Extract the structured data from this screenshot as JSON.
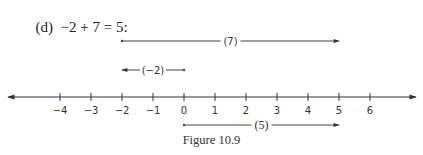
{
  "header": {
    "part": "(d)",
    "equation": "−2 + 7 = 5:"
  },
  "number_line": {
    "ticks": [
      -4,
      -3,
      -2,
      -1,
      0,
      1,
      2,
      3,
      4,
      5,
      6
    ],
    "tick_labels": [
      "−4",
      "−3",
      "−2",
      "−1",
      "0",
      "1",
      "2",
      "3",
      "4",
      "5",
      "6"
    ],
    "arrows_both_ends": true
  },
  "segments": [
    {
      "label": "(7)",
      "from": -2,
      "to": 5
    },
    {
      "label": "(−2)",
      "from": 0,
      "to": -2
    },
    {
      "label": "(5)",
      "from": 0,
      "to": 5
    }
  ],
  "caption": "Figure 10.9"
}
